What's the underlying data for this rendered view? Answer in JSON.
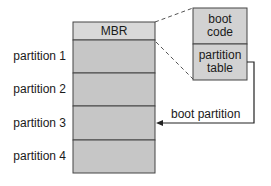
{
  "diagram": {
    "disk": {
      "header_label": "MBR",
      "partitions": [
        {
          "label": "partition 1"
        },
        {
          "label": "partition 2"
        },
        {
          "label": "partition 3"
        },
        {
          "label": "partition 4"
        }
      ]
    },
    "mbr_detail": {
      "top_label_line1": "boot",
      "top_label_line2": "code",
      "bottom_label_line1": "partition",
      "bottom_label_line2": "table"
    },
    "arrow": {
      "label": "boot partition",
      "target": "partition 3"
    },
    "colors": {
      "mbr_fill": "#d8d8d8",
      "partition_fill": "#c6c6c6",
      "detail_fill": "#d2d2d2",
      "stroke": "#333333"
    }
  }
}
